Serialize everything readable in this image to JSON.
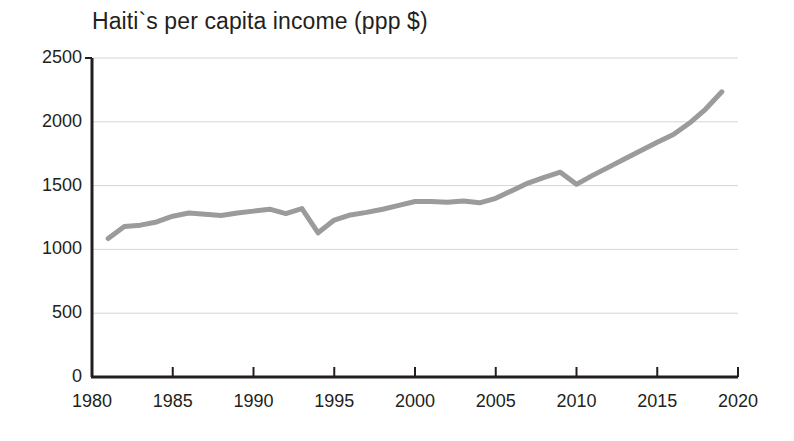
{
  "chart_data": {
    "type": "line",
    "title": "Haiti`s per capita income (ppp $)",
    "xlabel": "",
    "ylabel": "",
    "xlim": [
      1980,
      2020
    ],
    "ylim": [
      0,
      2500
    ],
    "grid": true,
    "legend": "none",
    "line_color": "#9b9b9b",
    "axis_color": "#231f20",
    "grid_color": "#d6d6d6",
    "y_ticks": [
      0,
      500,
      1000,
      1500,
      2000,
      2500
    ],
    "y_tick_labels": [
      "0",
      "500",
      "1000",
      "1500",
      "2000",
      "2500"
    ],
    "x_ticks": [
      1980,
      1985,
      1990,
      1995,
      2000,
      2005,
      2010,
      2015,
      2020
    ],
    "x_tick_labels": [
      "1980",
      "1985",
      "1990",
      "1995",
      "2000",
      "2005",
      "2010",
      "2015",
      "2020"
    ],
    "series": [
      {
        "name": "Haiti per capita income (ppp $)",
        "x": [
          1981,
          1982,
          1983,
          1984,
          1985,
          1986,
          1987,
          1988,
          1989,
          1990,
          1991,
          1992,
          1993,
          1994,
          1995,
          1996,
          1997,
          1998,
          1999,
          2000,
          2001,
          2002,
          2003,
          2004,
          2005,
          2006,
          2007,
          2008,
          2009,
          2010,
          2011,
          2012,
          2013,
          2014,
          2015,
          2016,
          2017,
          2018,
          2019
        ],
        "values": [
          1085,
          1180,
          1190,
          1215,
          1260,
          1285,
          1275,
          1265,
          1285,
          1300,
          1315,
          1280,
          1320,
          1130,
          1230,
          1270,
          1290,
          1315,
          1345,
          1375,
          1375,
          1370,
          1380,
          1365,
          1400,
          1460,
          1520,
          1565,
          1605,
          1510,
          1580,
          1645,
          1710,
          1775,
          1840,
          1900,
          1990,
          2100,
          2235
        ]
      }
    ]
  },
  "axes_geometry": {
    "plot_left": 92,
    "plot_right": 738,
    "plot_top": 58,
    "plot_bottom": 377
  }
}
